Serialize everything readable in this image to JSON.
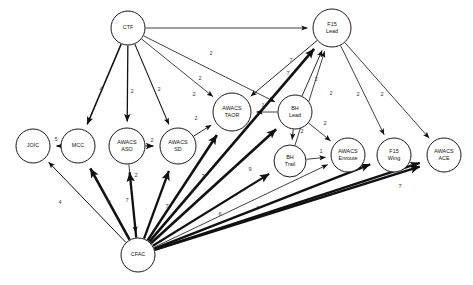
{
  "diagram": {
    "type": "directed-weighted-graph",
    "background_color": "#ffffff",
    "node_fill": "#ffffff",
    "node_stroke": "#1a1a1a",
    "edge_color": "#111111",
    "label_color": "#3a3a3a",
    "node_count": 13,
    "edge_count": 31
  },
  "nodes": [
    {
      "id": "CTF",
      "lines": [
        "CTF"
      ],
      "cx": 128,
      "cy": 28,
      "r": 17
    },
    {
      "id": "F15_LEAD",
      "lines": [
        "F15",
        "Lead"
      ],
      "cx": 332,
      "cy": 28,
      "r": 19
    },
    {
      "id": "AWACS_TAOR",
      "lines": [
        "AWACS",
        "TAOR"
      ],
      "cx": 232,
      "cy": 112,
      "r": 19
    },
    {
      "id": "BH_LEAD",
      "lines": [
        "BH",
        "Lead"
      ],
      "cx": 295,
      "cy": 112,
      "r": 17
    },
    {
      "id": "JOIC",
      "lines": [
        "JOIC"
      ],
      "cx": 33,
      "cy": 146,
      "r": 17
    },
    {
      "id": "MCC",
      "lines": [
        "MCC"
      ],
      "cx": 78,
      "cy": 146,
      "r": 17
    },
    {
      "id": "AWACS_ASO",
      "lines": [
        "AWACS",
        "ASO"
      ],
      "cx": 127,
      "cy": 146,
      "r": 18
    },
    {
      "id": "AWACS_SD",
      "lines": [
        "AWACS",
        "SD"
      ],
      "cx": 178,
      "cy": 146,
      "r": 18
    },
    {
      "id": "BH_TRAIL",
      "lines": [
        "BH",
        "Trail"
      ],
      "cx": 290,
      "cy": 161,
      "r": 16
    },
    {
      "id": "AWACS_ENROUTE",
      "lines": [
        "AWACS",
        "Enroute"
      ],
      "cx": 348,
      "cy": 155,
      "r": 17
    },
    {
      "id": "F15_WING",
      "lines": [
        "F15",
        "Wing"
      ],
      "cx": 394,
      "cy": 155,
      "r": 17
    },
    {
      "id": "AWACS_ACE",
      "lines": [
        "AWACS",
        "ACE"
      ],
      "cx": 444,
      "cy": 155,
      "r": 17
    },
    {
      "id": "CFAC",
      "lines": [
        "CFAC"
      ],
      "cx": 138,
      "cy": 255,
      "r": 17
    }
  ],
  "edges": [
    {
      "from": "CTF",
      "to": "MCC",
      "weight": "4",
      "width": 1.5,
      "lx": 101,
      "ly": 90
    },
    {
      "from": "CTF",
      "to": "AWACS_ASO",
      "weight": "2",
      "width": 1.3,
      "lx": 132,
      "ly": 92
    },
    {
      "from": "CTF",
      "to": "AWACS_SD",
      "weight": "2",
      "width": 1.1,
      "lx": 159,
      "ly": 90
    },
    {
      "from": "CTF",
      "to": "AWACS_TAOR",
      "weight": "2",
      "width": 0.8,
      "lx": 194,
      "ly": 95
    },
    {
      "from": "CTF",
      "to": "BH_LEAD",
      "weight": "2",
      "width": 0.8,
      "lx": 200,
      "ly": 79
    },
    {
      "from": "CTF",
      "to": "F15_LEAD",
      "weight": "2",
      "width": 0.8,
      "lx": 211,
      "ly": 54
    },
    {
      "from": "MCC",
      "to": "JOIC",
      "weight": "5",
      "width": 1.3,
      "lx": 56,
      "ly": 140
    },
    {
      "from": "AWACS_ASO",
      "to": "AWACS_SD",
      "weight": "2",
      "width": 1.2,
      "lx": 152,
      "ly": 141
    },
    {
      "from": "AWACS_ASO",
      "to": "CFAC",
      "weight": "2",
      "width": 0.8,
      "lx": 136,
      "ly": 176
    },
    {
      "from": "AWACS_SD",
      "to": "AWACS_TAOR",
      "weight": "2",
      "width": 0.9,
      "lx": 196,
      "ly": 119
    },
    {
      "from": "BH_LEAD",
      "to": "AWACS_TAOR",
      "weight": "1",
      "width": 0.8,
      "lx": 263,
      "ly": 106
    },
    {
      "from": "BH_LEAD",
      "to": "BH_TRAIL",
      "weight": "2",
      "width": 0.9,
      "lx": 302,
      "ly": 132
    },
    {
      "from": "BH_LEAD",
      "to": "AWACS_ENROUTE",
      "weight": "2",
      "width": 0.8,
      "lx": 325,
      "ly": 124
    },
    {
      "from": "BH_LEAD",
      "to": "F15_LEAD",
      "weight": "2",
      "width": 0.9,
      "lx": 316,
      "ly": 80
    },
    {
      "from": "BH_TRAIL",
      "to": "AWACS_ENROUTE",
      "weight": "1",
      "width": 0.8,
      "lx": 321,
      "ly": 152
    },
    {
      "from": "BH_TRAIL",
      "to": "F15_LEAD",
      "weight": "2",
      "width": 0.8,
      "lx": 331,
      "ly": 94
    },
    {
      "from": "F15_LEAD",
      "to": "AWACS_TAOR",
      "weight": "7",
      "width": 0.9,
      "lx": 288,
      "ly": 74
    },
    {
      "from": "F15_LEAD",
      "to": "F15_WING",
      "weight": "2",
      "width": 0.8,
      "lx": 358,
      "ly": 95
    },
    {
      "from": "F15_LEAD",
      "to": "AWACS_ACE",
      "weight": "2",
      "width": 0.8,
      "lx": 382,
      "ly": 95
    },
    {
      "from": "CFAC",
      "to": "JOIC",
      "weight": "4",
      "width": 1.0,
      "lx": 60,
      "ly": 203
    },
    {
      "from": "CFAC",
      "to": "MCC",
      "weight": "9",
      "width": 2.6,
      "lx": 109,
      "ly": 203
    },
    {
      "from": "CFAC",
      "to": "AWACS_ASO",
      "weight": "7",
      "width": 2.3,
      "lx": 127,
      "ly": 201
    },
    {
      "from": "CFAC",
      "to": "AWACS_SD",
      "weight": "7",
      "width": 2.3,
      "lx": 167,
      "ly": 207
    },
    {
      "from": "CFAC",
      "to": "AWACS_TAOR",
      "weight": "7",
      "width": 2.6,
      "lx": 193,
      "ly": 192
    },
    {
      "from": "CFAC",
      "to": "BH_LEAD",
      "weight": "7",
      "width": 2.6,
      "lx": 203,
      "ly": 177
    },
    {
      "from": "CFAC",
      "to": "F15_LEAD",
      "weight": "7",
      "width": 2.6,
      "lx": 291,
      "ly": 61
    },
    {
      "from": "CFAC",
      "to": "BH_TRAIL",
      "weight": "9",
      "width": 2.2,
      "lx": 250,
      "ly": 170
    },
    {
      "from": "CFAC",
      "to": "AWACS_ENROUTE",
      "weight": "6",
      "width": 0.8,
      "lx": 220,
      "ly": 215
    },
    {
      "from": "CFAC",
      "to": "F15_WING",
      "weight": "7",
      "width": 2.4,
      "lx": 258,
      "ly": 209
    },
    {
      "from": "CFAC",
      "to": "AWACS_ACE",
      "weight": "7",
      "width": 2.4,
      "lx": 363,
      "ly": 185
    },
    {
      "from": "CFAC",
      "to": "AWACS_ACE_2",
      "weight": "7",
      "width": 2.4,
      "lx": 400,
      "ly": 187
    }
  ]
}
